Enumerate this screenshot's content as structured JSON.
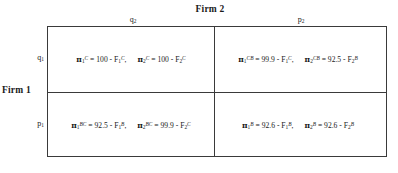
{
  "figure": {
    "type": "payoff-matrix",
    "rows": 2,
    "columns": 2
  },
  "column_player": {
    "title": "Firm 2",
    "strategies": [
      {
        "base": "q",
        "sub": "2"
      },
      {
        "base": "p",
        "sub": "2"
      }
    ]
  },
  "row_player": {
    "title": "Firm 1",
    "strategies": [
      {
        "base": "q",
        "sub": "1"
      },
      {
        "base": "p",
        "sub": "1"
      }
    ]
  },
  "cells": {
    "q1_q2": {
      "payoff_1": {
        "pi": "π",
        "pi_sub": "1",
        "pi_sup": "C",
        "equals": " = ",
        "constant": "100",
        "minus": " - ",
        "fixed": "F",
        "fixed_sub": "1",
        "fixed_sup": "C",
        "trailing": ","
      },
      "payoff_2": {
        "pi": "π",
        "pi_sub": "2",
        "pi_sup": "C",
        "equals": " = ",
        "constant": "100",
        "minus": " - ",
        "fixed": "F",
        "fixed_sub": "2",
        "fixed_sup": "C",
        "trailing": ""
      }
    },
    "q1_p2": {
      "payoff_1": {
        "pi": "π",
        "pi_sub": "1",
        "pi_sup": "CB",
        "equals": " = ",
        "constant": "99.9",
        "minus": " - ",
        "fixed": "F",
        "fixed_sub": "1",
        "fixed_sup": "C",
        "trailing": ","
      },
      "payoff_2": {
        "pi": "π",
        "pi_sub": "2",
        "pi_sup": "CB",
        "equals": " = ",
        "constant": "92.5",
        "minus": " - ",
        "fixed": "F",
        "fixed_sub": "2",
        "fixed_sup": "B",
        "trailing": ""
      }
    },
    "p1_q2": {
      "payoff_1": {
        "pi": "π",
        "pi_sub": "1",
        "pi_sup": "BC",
        "equals": " = ",
        "constant": "92.5",
        "minus": " - ",
        "fixed": "F",
        "fixed_sub": "1",
        "fixed_sup": "B",
        "trailing": ","
      },
      "payoff_2": {
        "pi": "π",
        "pi_sub": "2",
        "pi_sup": "BC",
        "equals": " = ",
        "constant": "99.9",
        "minus": " - ",
        "fixed": "F",
        "fixed_sub": "2",
        "fixed_sup": "C",
        "trailing": ""
      }
    },
    "p1_p2": {
      "payoff_1": {
        "pi": "π",
        "pi_sub": "1",
        "pi_sup": "B",
        "equals": " = ",
        "constant": "92.6",
        "minus": " - ",
        "fixed": "F",
        "fixed_sub": "1",
        "fixed_sup": "B",
        "trailing": ","
      },
      "payoff_2": {
        "pi": "π",
        "pi_sub": "2",
        "pi_sup": "B",
        "equals": " = ",
        "constant": "92.6",
        "minus": " - ",
        "fixed": "F",
        "fixed_sub": "2",
        "fixed_sup": "B",
        "trailing": ""
      }
    }
  },
  "colors": {
    "border": "#3a3a3a",
    "text": "#1a1a1a",
    "background": "#ffffff"
  }
}
